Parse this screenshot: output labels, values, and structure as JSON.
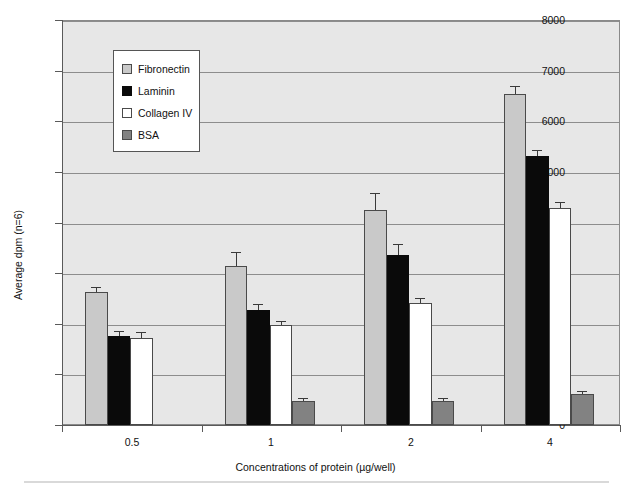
{
  "chart_data": {
    "type": "bar",
    "title": "",
    "xlabel": "Concentrations of protein (µg/well)",
    "ylabel": "Average dpm (n=6)",
    "categories": [
      "0.5",
      "1",
      "2",
      "4"
    ],
    "ylim": [
      0,
      8000
    ],
    "ytick_labels": [
      "0",
      "1000",
      "2000",
      "3000",
      "4000",
      "5000",
      "6000",
      "7000",
      "8000"
    ],
    "ytick_values": [
      0,
      1000,
      2000,
      3000,
      4000,
      5000,
      6000,
      7000,
      8000
    ],
    "grid": "horizontal",
    "legend_position": "upper-left-inside",
    "series": [
      {
        "name": "Fibronectin",
        "color": "#c9c9c9",
        "values": [
          2620,
          3150,
          4250,
          6540
        ],
        "errors": [
          110,
          260,
          330,
          160
        ]
      },
      {
        "name": "Laminin",
        "color": "#0a0a0a",
        "values": [
          1760,
          2280,
          3350,
          5320
        ],
        "errors": [
          100,
          120,
          220,
          110
        ]
      },
      {
        "name": "Collagen IV",
        "color": "#ffffff",
        "values": [
          1720,
          1970,
          2410,
          4290
        ],
        "errors": [
          110,
          90,
          100,
          110
        ]
      },
      {
        "name": "BSA",
        "color": "#828282",
        "values": [
          0,
          480,
          480,
          620
        ],
        "errors": [
          0,
          50,
          50,
          50
        ]
      }
    ]
  },
  "legend": {
    "entries": [
      {
        "label": "Fibronectin",
        "swatch": "fibronectin"
      },
      {
        "label": "Laminin",
        "swatch": "laminin"
      },
      {
        "label": "Collagen IV",
        "swatch": "collagen"
      },
      {
        "label": "BSA",
        "swatch": "bsa"
      }
    ]
  },
  "axes": {
    "x_title": "Concentrations of protein (µg/well)",
    "y_title": "Average dpm (n=6)"
  },
  "colors": {
    "plot_background": "#e7e7e7",
    "gridline": "#8d8d8d",
    "axis": "#5a5a5a",
    "page_background": "#ffffff"
  }
}
